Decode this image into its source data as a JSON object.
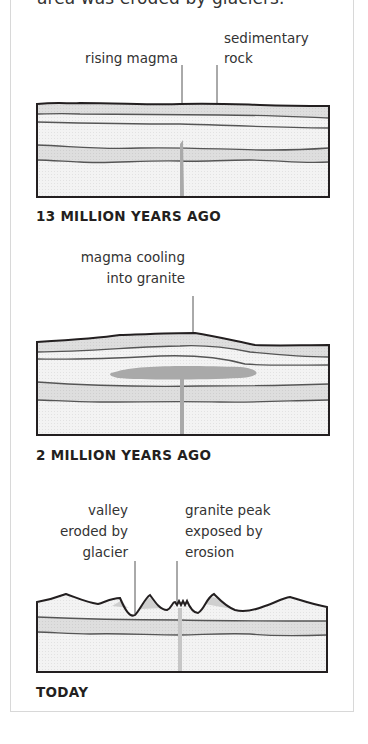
{
  "intro_text": "area was eroded by glaciers.",
  "diagrams": [
    {
      "caption": "13 MILLION YEARS AGO",
      "labels": [
        "rising magma",
        "sedimentary",
        "rock"
      ]
    },
    {
      "caption": "2 MILLION YEARS AGO",
      "labels": [
        "magma cooling",
        "into granite"
      ]
    },
    {
      "caption": "TODAY",
      "labels": [
        "valley",
        "eroded by",
        "glacier",
        "granite peak",
        "exposed by",
        "erosion"
      ]
    }
  ],
  "colors": {
    "outline": "#231f20",
    "layer_gray": "#dcdcdc",
    "layer_light": "#f2f2f2",
    "magma": "#a9a9a9",
    "panel_border": "#d8d8d8"
  }
}
